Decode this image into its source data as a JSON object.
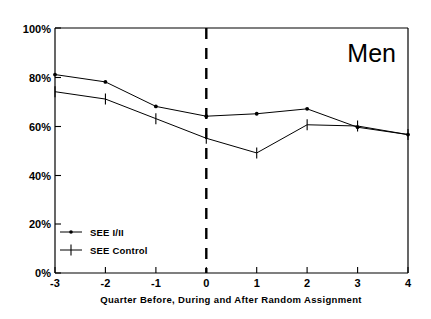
{
  "chart_data": {
    "type": "line",
    "title": "Men",
    "xlabel": "Quarter Before, During and After Random Assignment",
    "ylabel": "",
    "x": [
      -3,
      -2,
      -1,
      0,
      1,
      2,
      3,
      4
    ],
    "xticklabels": [
      "-3",
      "-2",
      "-1",
      "0",
      "1",
      "2",
      "3",
      "4"
    ],
    "yticklabels": [
      "0%",
      "20%",
      "40%",
      "60%",
      "80%",
      "100%"
    ],
    "yticks": [
      0,
      20,
      40,
      60,
      80,
      100
    ],
    "ylim": [
      0,
      100
    ],
    "xlim": [
      -3,
      4
    ],
    "grid": false,
    "legend_position": "lower-left-inside",
    "series": [
      {
        "name": "SEE I/II",
        "marker": "dot",
        "values": [
          81,
          78,
          68,
          64,
          65,
          67,
          59.5,
          56.5
        ]
      },
      {
        "name": "SEE Control",
        "marker": "plus",
        "values": [
          74,
          71,
          63,
          55,
          49,
          60.5,
          60,
          56.5
        ]
      }
    ],
    "annotations": [
      {
        "name": "random-assignment-line",
        "type": "vline",
        "x": 0,
        "style": "dashed"
      }
    ]
  },
  "legend": {
    "items": [
      {
        "label": "SEE I/II",
        "marker": "dot"
      },
      {
        "label": "SEE Control",
        "marker": "plus"
      }
    ]
  }
}
